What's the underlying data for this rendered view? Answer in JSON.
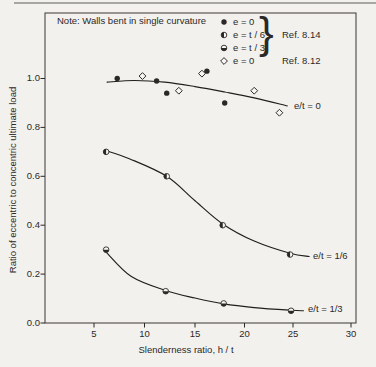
{
  "page": {
    "bg_color": "#f3f1ee",
    "ink_color": "#2b2927",
    "top_band_color": "#a8a6a2"
  },
  "chart_data": {
    "type": "scatter",
    "note": "Note:  Walls bent in single curvature",
    "xlabel": "Slenderness ratio, h / t",
    "ylabel": "Ratio of eccentric to concentric ultimate load",
    "x_ticks": [
      5,
      10,
      15,
      20,
      25,
      30
    ],
    "y_ticks": [
      "1.0",
      "0.8",
      "0.6",
      "0.4",
      "0.2",
      "0.0"
    ],
    "xlim": [
      0,
      30
    ],
    "ylim": [
      0,
      1.27
    ],
    "grid": false,
    "legend": {
      "position": "top-right-inside",
      "brace": "}",
      "group_ref": "Ref. 8.14",
      "diamond_ref": "Ref. 8.12",
      "items": [
        {
          "marker": "filled-circle",
          "text": "e = 0"
        },
        {
          "marker": "half-left-circle",
          "text": "e = t / 6"
        },
        {
          "marker": "half-bottom-circle",
          "text": "e = t / 3"
        },
        {
          "marker": "open-diamond",
          "text": "e = 0"
        }
      ]
    },
    "series": [
      {
        "name": "e = 0 (Ref. 8.14)",
        "marker": "filled-circle",
        "points": [
          [
            7.3,
            1.0
          ],
          [
            11.2,
            0.99
          ],
          [
            12.2,
            0.94
          ],
          [
            16.2,
            1.03
          ],
          [
            18.0,
            0.9
          ]
        ]
      },
      {
        "name": "e = 0 (Ref. 8.12)",
        "marker": "open-diamond",
        "points": [
          [
            9.8,
            1.01
          ],
          [
            13.4,
            0.95
          ],
          [
            15.7,
            1.02
          ],
          [
            21.0,
            0.95
          ],
          [
            23.6,
            0.86
          ]
        ]
      },
      {
        "name": "e = t/6 (Ref. 8.14)",
        "marker": "half-left-circle",
        "points": [
          [
            6.2,
            0.7
          ],
          [
            12.2,
            0.6
          ],
          [
            17.8,
            0.4
          ],
          [
            24.7,
            0.28
          ]
        ]
      },
      {
        "name": "e = t/3 (Ref. 8.14)",
        "marker": "half-bottom-circle",
        "points": [
          [
            6.2,
            0.3
          ],
          [
            12.1,
            0.13
          ],
          [
            17.9,
            0.08
          ],
          [
            24.8,
            0.05
          ]
        ]
      }
    ],
    "curves": [
      {
        "label": "e/t = 0",
        "points": [
          [
            6.3,
            0.985
          ],
          [
            9,
            0.992
          ],
          [
            12,
            0.985
          ],
          [
            15,
            0.967
          ],
          [
            18,
            0.945
          ],
          [
            21,
            0.921
          ],
          [
            24.4,
            0.888
          ]
        ]
      },
      {
        "label": "e/t = 1/6",
        "points": [
          [
            6.2,
            0.705
          ],
          [
            8.5,
            0.672
          ],
          [
            12.2,
            0.6
          ],
          [
            15,
            0.5
          ],
          [
            17.8,
            0.405
          ],
          [
            21,
            0.335
          ],
          [
            24.7,
            0.285
          ],
          [
            26.4,
            0.272
          ]
        ]
      },
      {
        "label": "e/t = 1/3",
        "points": [
          [
            6.2,
            0.29
          ],
          [
            8.7,
            0.19
          ],
          [
            12.1,
            0.133
          ],
          [
            15,
            0.102
          ],
          [
            17.9,
            0.078
          ],
          [
            21,
            0.063
          ],
          [
            24.8,
            0.052
          ],
          [
            25.9,
            0.05
          ]
        ]
      }
    ]
  }
}
